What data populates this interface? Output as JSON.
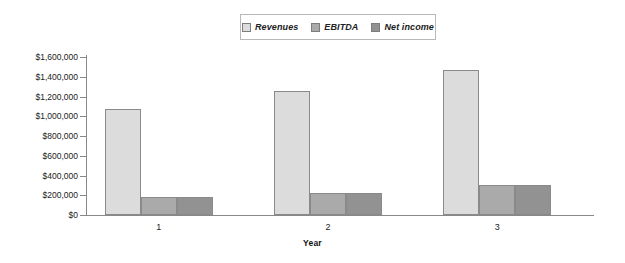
{
  "chart_data": {
    "type": "bar",
    "title": "",
    "subtitle": "",
    "xlabel": "Year",
    "ylabel": "",
    "categories": [
      "1",
      "2",
      "3"
    ],
    "series": [
      {
        "name": "Revenues",
        "values": [
          1070000,
          1255000,
          1465000
        ],
        "color": "#dcdcdc"
      },
      {
        "name": "EBITDA",
        "values": [
          182000,
          225000,
          300000
        ],
        "color": "#aaaaaa"
      },
      {
        "name": "Net income",
        "values": [
          180000,
          220000,
          300000
        ],
        "color": "#929292"
      }
    ],
    "ylim": [
      0,
      1600000
    ],
    "ytick_values": [
      0,
      200000,
      400000,
      600000,
      800000,
      1000000,
      1200000,
      1400000,
      1600000
    ],
    "ytick_labels": [
      "$0",
      "$200,000",
      "$400,000",
      "$600,000",
      "$800,000",
      "$1,000,000",
      "$1,200,000",
      "$1,400,000",
      "$1,600,000"
    ],
    "grid": false,
    "legend_position": "top-center",
    "legend_entries": [
      "Revenues",
      "EBITDA",
      "Net income"
    ]
  },
  "legend": {
    "items": [
      {
        "label": "Revenues"
      },
      {
        "label": "EBITDA"
      },
      {
        "label": "Net income"
      }
    ]
  },
  "axes": {
    "x_title": "Year",
    "x_categories": [
      "1",
      "2",
      "3"
    ],
    "y_labels": [
      "$1,600,000",
      "$1,400,000",
      "$1,200,000",
      "$1,000,000",
      "$800,000",
      "$600,000",
      "$400,000",
      "$200,000",
      "$0"
    ]
  }
}
